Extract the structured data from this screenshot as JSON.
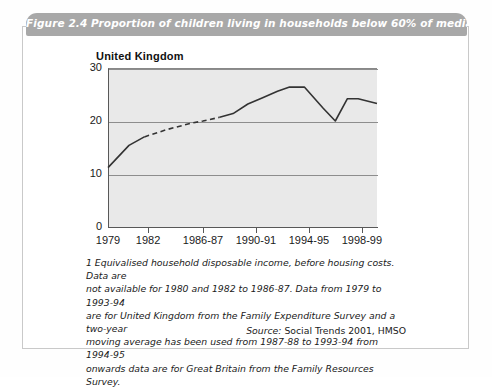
{
  "figure": {
    "title": "Figure 2.4  Proportion of children living in households below 60% of median income",
    "subtitle": "United Kingdom",
    "band_color": "#a8a8a8",
    "plot_background": "#e9e9e9",
    "line_color": "#333333"
  },
  "footnote": {
    "lines": [
      "1 Equivalised household disposable income, before housing costs. Data are",
      "not available for 1980 and 1982 to 1986-87. Data from 1979 to 1993-94",
      "are for United Kingdom from the Family Expenditure Survey and a two-year",
      "moving average has been used from 1987-88 to 1993-94 from 1994-95",
      "onwards data are for Great Britain from the Family Resources Survey."
    ]
  },
  "source": {
    "lead": "Source:",
    "text": " Social Trends 2001, HMSO"
  },
  "chart_data": {
    "type": "line",
    "title": "Proportion of children living in households below 60% of median income",
    "subtitle": "United Kingdom",
    "xlabel": "",
    "ylabel": "Percentages",
    "ylim": [
      0,
      30
    ],
    "yticks": [
      0,
      10,
      20,
      30
    ],
    "grid": true,
    "legend": "none",
    "xtick_labels": [
      "1979",
      "1982",
      "1986-87",
      "1990-91",
      "1994-95",
      "1998-99"
    ],
    "xtick_positions_pct": [
      0,
      14.9,
      35.3,
      55.0,
      74.7,
      94.4
    ],
    "series": [
      {
        "name": "Children in households below 60% of median income",
        "style": "solid-dashed-solid",
        "points": [
          {
            "x_pct": 0.0,
            "value": 11.2,
            "segment": "solid"
          },
          {
            "x_pct": 7.8,
            "value": 15.4,
            "segment": "solid"
          },
          {
            "x_pct": 13.5,
            "value": 17.0,
            "segment": "dashed"
          },
          {
            "x_pct": 22.0,
            "value": 18.4,
            "segment": "dashed"
          },
          {
            "x_pct": 31.0,
            "value": 19.6,
            "segment": "dashed"
          },
          {
            "x_pct": 35.3,
            "value": 20.0,
            "segment": "dashed"
          },
          {
            "x_pct": 41.5,
            "value": 20.7,
            "segment": "solid"
          },
          {
            "x_pct": 46.5,
            "value": 21.4,
            "segment": "solid"
          },
          {
            "x_pct": 52.0,
            "value": 23.2,
            "segment": "solid"
          },
          {
            "x_pct": 57.5,
            "value": 24.4,
            "segment": "solid"
          },
          {
            "x_pct": 63.0,
            "value": 25.6,
            "segment": "solid"
          },
          {
            "x_pct": 67.5,
            "value": 26.4,
            "segment": "solid"
          },
          {
            "x_pct": 73.0,
            "value": 26.4,
            "segment": "solid"
          },
          {
            "x_pct": 80.0,
            "value": 22.4,
            "segment": "solid"
          },
          {
            "x_pct": 84.5,
            "value": 20.0,
            "segment": "solid"
          },
          {
            "x_pct": 89.0,
            "value": 24.2,
            "segment": "solid"
          },
          {
            "x_pct": 93.0,
            "value": 24.2,
            "segment": "solid"
          },
          {
            "x_pct": 100.0,
            "value": 23.3,
            "segment": "solid"
          }
        ]
      }
    ]
  }
}
